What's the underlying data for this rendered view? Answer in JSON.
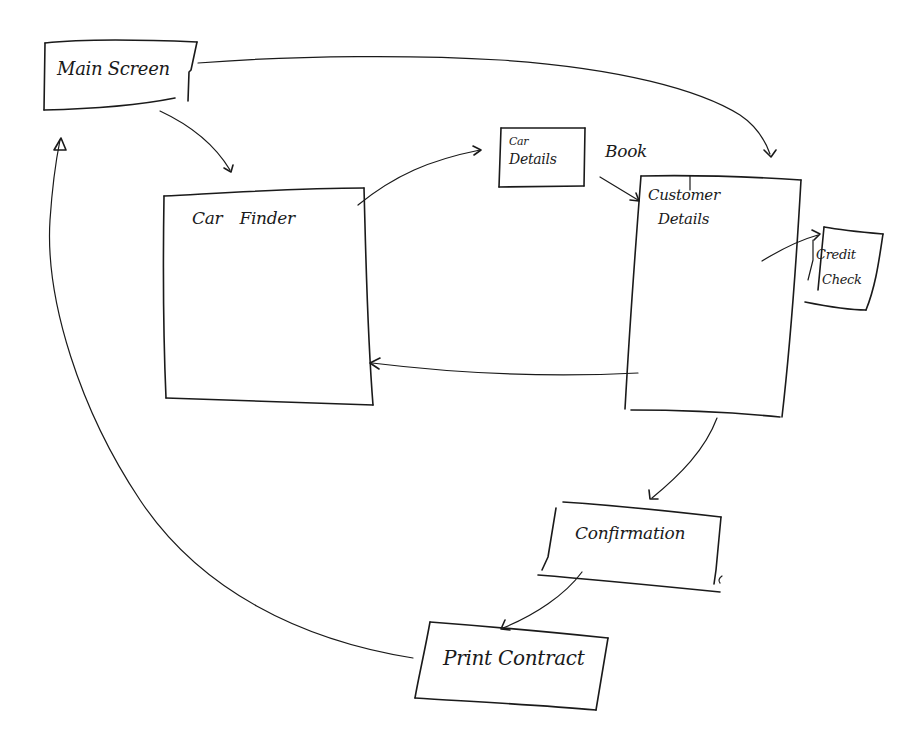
{
  "diagram": {
    "type": "hand-drawn screen flow",
    "stroke_color": "#1a1a1a",
    "background": "#ffffff",
    "nodes": [
      {
        "id": "main-screen",
        "label": "Main Screen"
      },
      {
        "id": "car-finder",
        "label": "Car Finder"
      },
      {
        "id": "car-details",
        "label_line1": "Car",
        "label_line2": "Details"
      },
      {
        "id": "customer-details",
        "label_line1": "Customer",
        "label_line2": "Details"
      },
      {
        "id": "credit-check",
        "label_line1": "Credit",
        "label_line2": "Check"
      },
      {
        "id": "confirmation",
        "label": "Confirmation"
      },
      {
        "id": "print-contract",
        "label": "Print Contract"
      }
    ],
    "annotations": {
      "book": "Book"
    },
    "edges": [
      {
        "from": "main-screen",
        "to": "car-finder"
      },
      {
        "from": "main-screen",
        "to": "customer-details"
      },
      {
        "from": "car-finder",
        "to": "car-details"
      },
      {
        "from": "car-details",
        "to": "customer-details",
        "label": "Book"
      },
      {
        "from": "customer-details",
        "to": "credit-check"
      },
      {
        "from": "customer-details",
        "to": "car-finder"
      },
      {
        "from": "customer-details",
        "to": "confirmation"
      },
      {
        "from": "confirmation",
        "to": "print-contract"
      },
      {
        "from": "print-contract",
        "to": "main-screen"
      }
    ]
  }
}
